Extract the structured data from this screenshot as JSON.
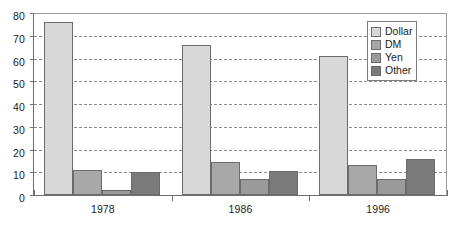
{
  "chart_data": {
    "type": "bar",
    "title": "",
    "subtitle": "",
    "xlabel": "",
    "ylabel": "",
    "categories": [
      "1978",
      "1986",
      "1996"
    ],
    "series": [
      {
        "name": "Dollar",
        "color": "#d8d8d8",
        "values": [
          76,
          66,
          61
        ]
      },
      {
        "name": "DM",
        "color": "#a8a8a8",
        "values": [
          11,
          14.5,
          13
        ]
      },
      {
        "name": "Yen",
        "color": "#9a9a9a",
        "values": [
          2,
          7,
          7
        ]
      },
      {
        "name": "Other",
        "color": "#7a7a7a",
        "values": [
          10,
          10.5,
          16
        ]
      }
    ],
    "ylim": [
      0,
      80
    ],
    "yticks": [
      0,
      10,
      20,
      30,
      40,
      50,
      60,
      70,
      80
    ],
    "ytick_labels": [
      "0",
      "10",
      "20",
      "30",
      "40",
      "50",
      "60",
      "70",
      "80"
    ],
    "grid": true,
    "grid_style": "dashed",
    "grid_axis": "y",
    "legend_position": "top-right",
    "legend_entries": [
      "Dollar",
      "DM",
      "Yen",
      "Other"
    ]
  },
  "axes": {
    "y_tick_labels": [
      "80",
      "70",
      "60",
      "50",
      "40",
      "30",
      "20",
      "10",
      "0"
    ],
    "x_tick_labels": [
      "1978",
      "1986",
      "1996"
    ]
  },
  "legend": {
    "items": [
      {
        "label": "Dollar"
      },
      {
        "label": "DM"
      },
      {
        "label": "Yen"
      },
      {
        "label": "Other"
      }
    ]
  }
}
